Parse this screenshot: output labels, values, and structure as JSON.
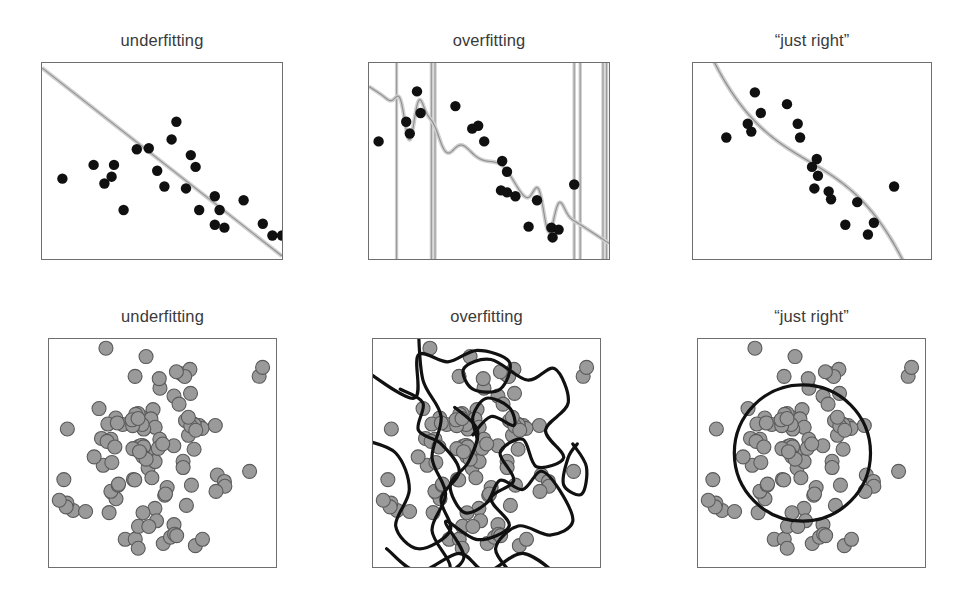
{
  "figure": {
    "width": 965,
    "height": 593,
    "background": "#ffffff",
    "colors": {
      "frame": "#6f6f6f",
      "title_text": "#3a3a3a",
      "regression_point": "#101010",
      "cluster_point_fill": "#9a9a9a",
      "cluster_point_stroke": "#5a5a5a",
      "fit_line_light": "#cfcfcf",
      "fit_line_dark": "#8f8f8f",
      "boundary_line": "#111111"
    }
  },
  "panels": [
    {
      "id": "regression-underfitting",
      "row": 0,
      "col": 0,
      "title": "underfitting",
      "frame": {
        "x": 41,
        "y": 62,
        "w": 242,
        "h": 198
      },
      "model": "linear"
    },
    {
      "id": "regression-overfitting",
      "row": 0,
      "col": 1,
      "title": "overfitting",
      "frame": {
        "x": 368,
        "y": 62,
        "w": 242,
        "h": 198
      },
      "model": "high-degree-polynomial"
    },
    {
      "id": "regression-just-right",
      "row": 0,
      "col": 2,
      "title": "“just right”",
      "frame": {
        "x": 692,
        "y": 62,
        "w": 240,
        "h": 198
      },
      "model": "cubic"
    },
    {
      "id": "cluster-underfitting",
      "row": 1,
      "col": 0,
      "title": "underfitting",
      "frame": {
        "x": 48,
        "y": 338,
        "w": 229,
        "h": 230
      },
      "model": "no-boundary"
    },
    {
      "id": "cluster-overfitting",
      "row": 1,
      "col": 1,
      "title": "overfitting",
      "frame": {
        "x": 372,
        "y": 338,
        "w": 229,
        "h": 230
      },
      "model": "wiggly-boundary"
    },
    {
      "id": "cluster-just-right",
      "row": 1,
      "col": 2,
      "title": "“just right”",
      "frame": {
        "x": 697,
        "y": 338,
        "w": 229,
        "h": 230
      },
      "model": "circle-boundary"
    }
  ],
  "chart_data": [
    {
      "type": "scatter",
      "panel": "regression-underfitting",
      "title": "underfitting",
      "xlabel": "",
      "ylabel": "",
      "xlim": [
        0,
        1
      ],
      "ylim": [
        0,
        1
      ],
      "grid": false,
      "legend": null,
      "marker_radius_px": 5.2,
      "points": [
        [
          0.215,
          0.48
        ],
        [
          0.34,
          0.25
        ],
        [
          0.445,
          0.565
        ],
        [
          0.48,
          0.45
        ],
        [
          0.54,
          0.61
        ],
        [
          0.56,
          0.7
        ],
        [
          0.62,
          0.53
        ],
        [
          0.26,
          0.385
        ],
        [
          0.29,
          0.42
        ],
        [
          0.3,
          0.48
        ],
        [
          0.51,
          0.37
        ],
        [
          0.6,
          0.36
        ],
        [
          0.655,
          0.25
        ],
        [
          0.72,
          0.32
        ],
        [
          0.74,
          0.25
        ],
        [
          0.76,
          0.16
        ],
        [
          0.84,
          0.3
        ],
        [
          0.92,
          0.18
        ],
        [
          0.96,
          0.12
        ],
        [
          1.0,
          0.12
        ],
        [
          0.085,
          0.41
        ],
        [
          0.395,
          0.56
        ],
        [
          0.64,
          0.47
        ],
        [
          0.72,
          0.175
        ]
      ],
      "fit": {
        "name": "linear-fit",
        "kind": "line",
        "description": "straight descending line from upper-left to lower-right",
        "endpoints": [
          [
            0.0,
            0.975
          ],
          [
            1.0,
            0.015
          ]
        ]
      }
    },
    {
      "type": "scatter",
      "panel": "regression-overfitting",
      "title": "overfitting",
      "xlabel": "",
      "ylabel": "",
      "xlim": [
        0,
        1
      ],
      "ylim": [
        0,
        1
      ],
      "grid": false,
      "legend": null,
      "marker_radius_px": 5.2,
      "points": [
        [
          0.04,
          0.6
        ],
        [
          0.155,
          0.7
        ],
        [
          0.17,
          0.64
        ],
        [
          0.2,
          0.855
        ],
        [
          0.215,
          0.745
        ],
        [
          0.36,
          0.78
        ],
        [
          0.43,
          0.665
        ],
        [
          0.455,
          0.68
        ],
        [
          0.48,
          0.6
        ],
        [
          0.555,
          0.5
        ],
        [
          0.575,
          0.445
        ],
        [
          0.55,
          0.35
        ],
        [
          0.575,
          0.34
        ],
        [
          0.61,
          0.32
        ],
        [
          0.7,
          0.3
        ],
        [
          0.665,
          0.165
        ],
        [
          0.76,
          0.16
        ],
        [
          0.79,
          0.15
        ],
        [
          0.765,
          0.11
        ],
        [
          0.855,
          0.38
        ]
      ],
      "fit": {
        "name": "overfit-polynomial",
        "kind": "curve",
        "description": "wildly oscillating high-degree polynomial with near-vertical asymptotic excursions"
      }
    },
    {
      "type": "scatter",
      "panel": "regression-just-right",
      "title": "“just right”",
      "xlabel": "",
      "ylabel": "",
      "xlim": [
        0,
        1
      ],
      "ylim": [
        0,
        1
      ],
      "grid": false,
      "legend": null,
      "marker_radius_px": 5.2,
      "points": [
        [
          0.14,
          0.62
        ],
        [
          0.23,
          0.69
        ],
        [
          0.245,
          0.65
        ],
        [
          0.26,
          0.85
        ],
        [
          0.285,
          0.745
        ],
        [
          0.395,
          0.79
        ],
        [
          0.44,
          0.69
        ],
        [
          0.45,
          0.62
        ],
        [
          0.52,
          0.51
        ],
        [
          0.5,
          0.47
        ],
        [
          0.525,
          0.425
        ],
        [
          0.51,
          0.36
        ],
        [
          0.57,
          0.345
        ],
        [
          0.58,
          0.305
        ],
        [
          0.69,
          0.29
        ],
        [
          0.64,
          0.175
        ],
        [
          0.76,
          0.185
        ],
        [
          0.735,
          0.125
        ],
        [
          0.845,
          0.37
        ]
      ],
      "fit": {
        "name": "cubic-fit",
        "kind": "curve",
        "description": "cubic polynomial rising to a peak on the left, dipping to a trough on the right, then rising steeply"
      }
    },
    {
      "type": "scatter",
      "panel": "cluster-underfitting",
      "title": "underfitting",
      "xlabel": "",
      "ylabel": "",
      "xlim": [
        0,
        1
      ],
      "ylim": [
        0,
        1
      ],
      "grid": false,
      "legend": null,
      "n_points": 108,
      "marker_radius_px": 7.0,
      "description": "roughly circular cloud of grey points; no decision boundary drawn",
      "fit": {
        "name": "none",
        "kind": "none"
      }
    },
    {
      "type": "scatter",
      "panel": "cluster-overfitting",
      "title": "overfitting",
      "xlabel": "",
      "ylabel": "",
      "xlim": [
        0,
        1
      ],
      "ylim": [
        0,
        1
      ],
      "grid": false,
      "legend": null,
      "n_points": 108,
      "marker_radius_px": 7.0,
      "description": "same point cloud with an extremely convoluted, self-intersecting decision boundary threading between individual points",
      "fit": {
        "name": "wiggly-decision-boundary",
        "kind": "closed-curve"
      }
    },
    {
      "type": "scatter",
      "panel": "cluster-just-right",
      "title": "“just right”",
      "xlabel": "",
      "ylabel": "",
      "xlim": [
        0,
        1
      ],
      "ylim": [
        0,
        1
      ],
      "grid": false,
      "legend": null,
      "n_points": 108,
      "marker_radius_px": 7.0,
      "description": "same point cloud with a single smooth circular decision boundary near the centre",
      "fit": {
        "name": "circular-decision-boundary",
        "kind": "circle",
        "center": [
          0.46,
          0.5
        ],
        "radius": 0.3
      }
    }
  ]
}
